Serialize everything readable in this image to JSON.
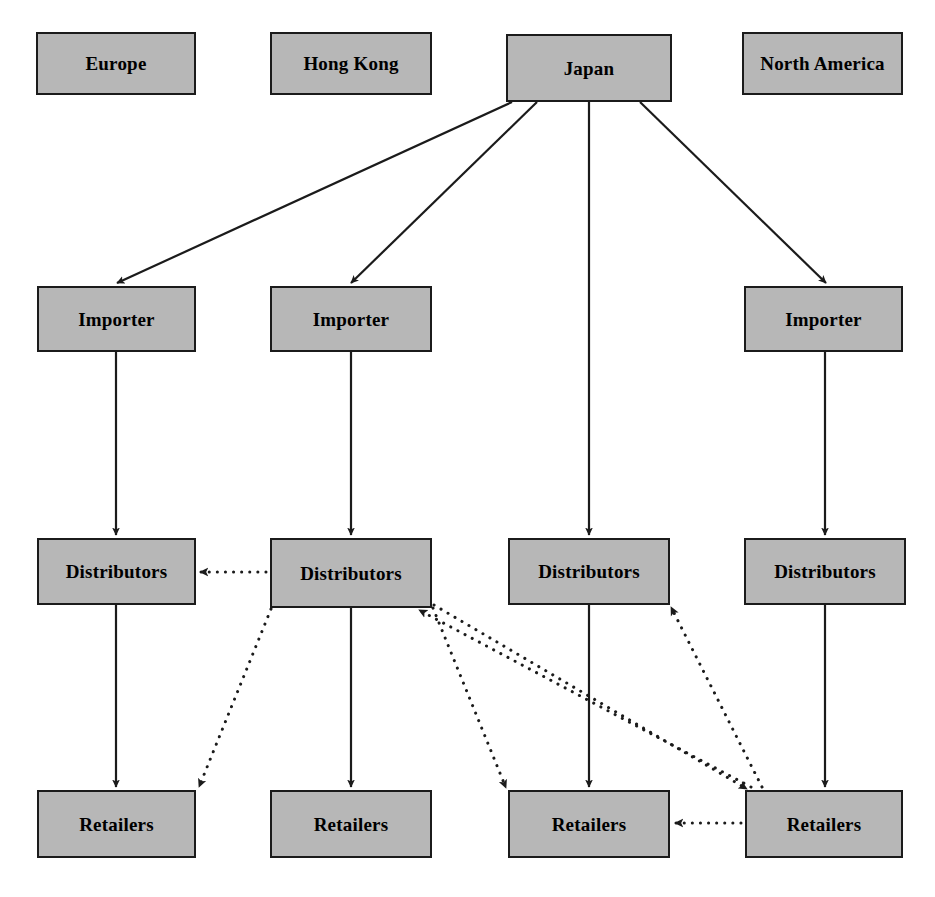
{
  "diagram": {
    "colors": {
      "node_fill": "#b7b7b7",
      "node_border": "#1b1b1b",
      "solid_edge": "#1b1b1b",
      "dotted_edge": "#1b1b1b",
      "background": "#ffffff"
    },
    "columns": [
      {
        "id": "col-europe",
        "region": "Europe"
      },
      {
        "id": "col-hong-kong",
        "region": "Hong Kong"
      },
      {
        "id": "col-japan",
        "region": "Japan"
      },
      {
        "id": "col-north-america",
        "region": "North America"
      }
    ],
    "nodes": [
      {
        "id": "region-europe",
        "label": "Europe",
        "type": "region",
        "x": 36,
        "y": 32,
        "w": 160,
        "h": 63
      },
      {
        "id": "region-hong-kong",
        "label": "Hong Kong",
        "type": "region",
        "x": 270,
        "y": 32,
        "w": 162,
        "h": 63
      },
      {
        "id": "region-japan",
        "label": "Japan",
        "type": "region",
        "x": 506,
        "y": 34,
        "w": 166,
        "h": 68
      },
      {
        "id": "region-north-america",
        "label": "North America",
        "type": "region",
        "x": 742,
        "y": 32,
        "w": 161,
        "h": 63
      },
      {
        "id": "importer-1",
        "label": "Importer",
        "type": "importer",
        "x": 37,
        "y": 286,
        "w": 159,
        "h": 66
      },
      {
        "id": "importer-2",
        "label": "Importer",
        "type": "importer",
        "x": 270,
        "y": 286,
        "w": 162,
        "h": 66
      },
      {
        "id": "importer-4",
        "label": "Importer",
        "type": "importer",
        "x": 744,
        "y": 286,
        "w": 159,
        "h": 66
      },
      {
        "id": "distributors-1",
        "label": "Distributors",
        "type": "distributors",
        "x": 37,
        "y": 538,
        "w": 159,
        "h": 67
      },
      {
        "id": "distributors-2",
        "label": "Distributors",
        "type": "distributors",
        "x": 270,
        "y": 538,
        "w": 162,
        "h": 70
      },
      {
        "id": "distributors-3",
        "label": "Distributors",
        "type": "distributors",
        "x": 508,
        "y": 538,
        "w": 162,
        "h": 67
      },
      {
        "id": "distributors-4",
        "label": "Distributors",
        "type": "distributors",
        "x": 744,
        "y": 538,
        "w": 162,
        "h": 67
      },
      {
        "id": "retailers-1",
        "label": "Retailers",
        "type": "retailers",
        "x": 37,
        "y": 790,
        "w": 159,
        "h": 68
      },
      {
        "id": "retailers-2",
        "label": "Retailers",
        "type": "retailers",
        "x": 270,
        "y": 790,
        "w": 162,
        "h": 68
      },
      {
        "id": "retailers-3",
        "label": "Retailers",
        "type": "retailers",
        "x": 508,
        "y": 790,
        "w": 162,
        "h": 68
      },
      {
        "id": "retailers-4",
        "label": "Retailers",
        "type": "retailers",
        "x": 745,
        "y": 790,
        "w": 158,
        "h": 68
      }
    ],
    "edges": [
      {
        "id": "edge-japan-importer1",
        "from": "region-japan",
        "to": "importer-1",
        "style": "solid",
        "x1": 512,
        "y1": 102,
        "x2": 117,
        "y2": 283
      },
      {
        "id": "edge-japan-importer2",
        "from": "region-japan",
        "to": "importer-2",
        "style": "solid",
        "x1": 537,
        "y1": 102,
        "x2": 351,
        "y2": 283
      },
      {
        "id": "edge-japan-distributors3",
        "from": "region-japan",
        "to": "distributors-3",
        "style": "solid",
        "x1": 589,
        "y1": 102,
        "x2": 589,
        "y2": 535
      },
      {
        "id": "edge-japan-importer4",
        "from": "region-japan",
        "to": "importer-4",
        "style": "solid",
        "x1": 640,
        "y1": 102,
        "x2": 826,
        "y2": 283
      },
      {
        "id": "edge-importer1-distributors1",
        "from": "importer-1",
        "to": "distributors-1",
        "style": "solid",
        "x1": 116,
        "y1": 352,
        "x2": 116,
        "y2": 535
      },
      {
        "id": "edge-importer2-distributors2",
        "from": "importer-2",
        "to": "distributors-2",
        "style": "solid",
        "x1": 351,
        "y1": 352,
        "x2": 351,
        "y2": 535
      },
      {
        "id": "edge-importer4-distributors4",
        "from": "importer-4",
        "to": "distributors-4",
        "style": "solid",
        "x1": 825,
        "y1": 352,
        "x2": 825,
        "y2": 535
      },
      {
        "id": "edge-distributors1-retailers1",
        "from": "distributors-1",
        "to": "retailers-1",
        "style": "solid",
        "x1": 116,
        "y1": 605,
        "x2": 116,
        "y2": 787
      },
      {
        "id": "edge-distributors2-retailers2",
        "from": "distributors-2",
        "to": "retailers-2",
        "style": "solid",
        "x1": 351,
        "y1": 608,
        "x2": 351,
        "y2": 787
      },
      {
        "id": "edge-distributors3-retailers3",
        "from": "distributors-3",
        "to": "retailers-3",
        "style": "solid",
        "x1": 589,
        "y1": 605,
        "x2": 589,
        "y2": 787
      },
      {
        "id": "edge-distributors4-retailers4",
        "from": "distributors-4",
        "to": "retailers-4",
        "style": "solid",
        "x1": 825,
        "y1": 605,
        "x2": 825,
        "y2": 787
      },
      {
        "id": "edge-distributors2-distributors1",
        "from": "distributors-2",
        "to": "distributors-1",
        "style": "dotted",
        "x1": 266,
        "y1": 572,
        "x2": 200,
        "y2": 572
      },
      {
        "id": "edge-distributors2-retailers1",
        "from": "distributors-2",
        "to": "retailers-1",
        "style": "dotted",
        "x1": 271,
        "y1": 609,
        "x2": 199,
        "y2": 787
      },
      {
        "id": "edge-distributors2-retailers3",
        "from": "distributors-2",
        "to": "retailers-3",
        "style": "dotted",
        "x1": 433,
        "y1": 608,
        "x2": 506,
        "y2": 788
      },
      {
        "id": "edge-distributors2-retailers4",
        "from": "distributors-2",
        "to": "retailers-4",
        "style": "dotted",
        "x1": 434,
        "y1": 605,
        "x2": 747,
        "y2": 789
      },
      {
        "id": "edge-retailers4-distributors2",
        "from": "retailers-4",
        "to": "distributors-2",
        "style": "dotted",
        "x1": 751,
        "y1": 787,
        "x2": 419,
        "y2": 610
      },
      {
        "id": "edge-retailers4-distributors3",
        "from": "retailers-4",
        "to": "distributors-3",
        "style": "dotted",
        "x1": 762,
        "y1": 787,
        "x2": 671,
        "y2": 607
      },
      {
        "id": "edge-retailers4-retailers3",
        "from": "retailers-4",
        "to": "retailers-3",
        "style": "dotted",
        "x1": 741,
        "y1": 823,
        "x2": 675,
        "y2": 823
      }
    ]
  }
}
